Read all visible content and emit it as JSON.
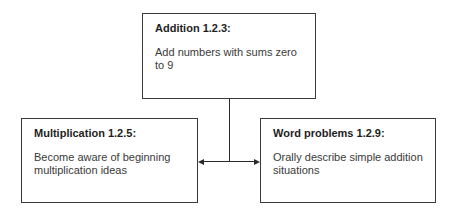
{
  "boxes": {
    "top": {
      "title": "Addition 1.2.3:",
      "body": "Add numbers with sums zero to 9"
    },
    "left": {
      "title": "Multiplication 1.2.5:",
      "body": "Become aware of beginning multiplication ideas"
    },
    "right": {
      "title": "Word problems 1.2.9:",
      "body": "Orally describe simple addition situations"
    }
  },
  "colors": {
    "border": "#3a3a3a",
    "text": "#2a2a2a"
  }
}
